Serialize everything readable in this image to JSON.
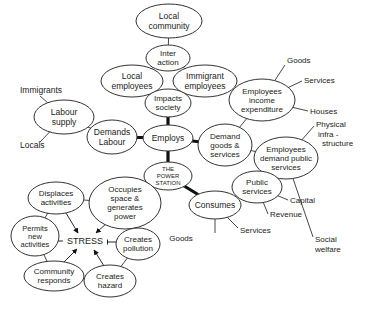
{
  "diagram": {
    "center": "THE POWER STATION",
    "nodes": [
      {
        "id": "local_community",
        "lines": [
          "Local",
          "community"
        ]
      },
      {
        "id": "interaction",
        "lines": [
          "Inter",
          "action"
        ]
      },
      {
        "id": "local_employees",
        "lines": [
          "Local",
          "employees"
        ]
      },
      {
        "id": "immigrant_employees",
        "lines": [
          "Immigrant",
          "employees"
        ]
      },
      {
        "id": "impacts_society",
        "lines": [
          "Impacts",
          "society"
        ]
      },
      {
        "id": "labour_supply",
        "lines": [
          "Labour",
          "supply"
        ]
      },
      {
        "id": "demands_labour",
        "lines": [
          "Demands",
          "Labour"
        ]
      },
      {
        "id": "employs",
        "lines": [
          "Employs"
        ]
      },
      {
        "id": "employees_income",
        "lines": [
          "Employees",
          "income",
          "expenditure"
        ]
      },
      {
        "id": "demand_goods",
        "lines": [
          "Demand",
          "goods &",
          "services"
        ]
      },
      {
        "id": "employees_public",
        "lines": [
          "Employees",
          "demand public",
          "services"
        ]
      },
      {
        "id": "power_station",
        "lines": [
          "THE",
          "POWER",
          "STATION"
        ]
      },
      {
        "id": "public_services",
        "lines": [
          "Public",
          "services"
        ]
      },
      {
        "id": "consumes",
        "lines": [
          "Consumes"
        ]
      },
      {
        "id": "displaces",
        "lines": [
          "Displaces",
          "activities"
        ]
      },
      {
        "id": "occupies",
        "lines": [
          "Occupies",
          "space &",
          "generates",
          "power"
        ]
      },
      {
        "id": "permits",
        "lines": [
          "Permits",
          "new",
          "activities"
        ]
      },
      {
        "id": "creates_pollution",
        "lines": [
          "Creates",
          "pollution"
        ]
      },
      {
        "id": "community_responds",
        "lines": [
          "Community",
          "responds"
        ]
      },
      {
        "id": "creates_hazard",
        "lines": [
          "Creates",
          "hazard"
        ]
      }
    ],
    "labels": [
      {
        "id": "immigrants",
        "text": "Immigrants"
      },
      {
        "id": "locals",
        "text": "Locals"
      },
      {
        "id": "goods_top",
        "text": "Goods"
      },
      {
        "id": "services_top",
        "text": "Services"
      },
      {
        "id": "houses",
        "text": "Houses"
      },
      {
        "id": "physical_infra",
        "lines": [
          "Physical",
          "infra -",
          "structure"
        ]
      },
      {
        "id": "social_welfare",
        "lines": [
          "Social",
          "welfare"
        ]
      },
      {
        "id": "capital",
        "text": "Capital"
      },
      {
        "id": "revenue",
        "text": "Revenue"
      },
      {
        "id": "services_bottom",
        "text": "Services"
      },
      {
        "id": "goods_bottom",
        "text": "Goods"
      },
      {
        "id": "stress",
        "text": "STRESS"
      }
    ]
  }
}
